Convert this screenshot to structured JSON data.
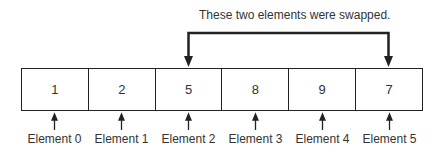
{
  "caption": "These two elements were swapped.",
  "array": {
    "values": [
      "1",
      "2",
      "5",
      "8",
      "9",
      "7"
    ],
    "labels": [
      "Element 0",
      "Element 1",
      "Element 2",
      "Element 3",
      "Element 4",
      "Element 5"
    ]
  },
  "swap": {
    "from_index": 2,
    "to_index": 5
  },
  "colors": {
    "stroke": "#222222",
    "background": "#ffffff"
  }
}
